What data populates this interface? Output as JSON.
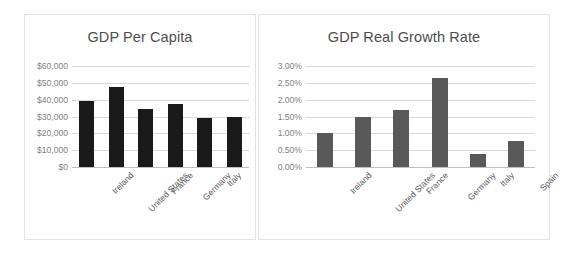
{
  "chart_data": [
    {
      "type": "bar",
      "id": "gdp-per-capita",
      "title": "GDP Per Capita",
      "xlabel": "",
      "ylabel": "",
      "categories": [
        "Ireland",
        "United States",
        "France",
        "Germany",
        "Italy",
        "Spain"
      ],
      "values": [
        39200,
        47500,
        34500,
        37300,
        29400,
        29900
      ],
      "ylim": [
        0,
        60000
      ],
      "ytick_values": [
        0,
        10000,
        20000,
        30000,
        40000,
        50000,
        60000
      ],
      "ytick_labels": [
        "$0",
        "$10,000",
        "$20,000",
        "$30,000",
        "$40,000",
        "$50,000",
        "$60,000"
      ],
      "bar_color": "#1a1a1a",
      "grid": true,
      "legend": false
    },
    {
      "type": "bar",
      "id": "gdp-real-growth-rate",
      "title": "GDP Real Growth Rate",
      "xlabel": "",
      "ylabel": "",
      "categories": [
        "Ireland",
        "United States",
        "France",
        "Germany",
        "Italy",
        "Spain"
      ],
      "values": [
        1.0,
        1.5,
        1.7,
        2.65,
        0.38,
        0.78
      ],
      "ylim": [
        0,
        3.0
      ],
      "ytick_values": [
        0,
        0.5,
        1.0,
        1.5,
        2.0,
        2.5,
        3.0
      ],
      "ytick_labels": [
        "0.00%",
        "0.50%",
        "1.00%",
        "1.50%",
        "2.00%",
        "2.50%",
        "3.00%"
      ],
      "bar_color": "#595959",
      "grid": true,
      "legend": false
    }
  ],
  "colors": {
    "panel_border": "#e3e3e3",
    "gridline": "#d9d9d9",
    "baseline": "#bfbfbf",
    "title_text": "#4d4d4d",
    "axis_text": "#7f7f7f",
    "category_text": "#595959",
    "background": "#ffffff"
  }
}
